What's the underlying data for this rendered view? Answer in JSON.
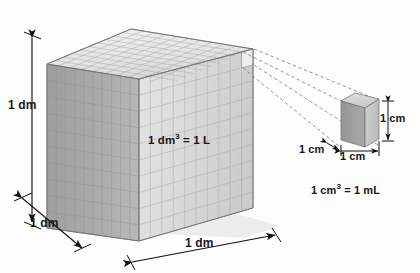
{
  "figure": {
    "background_color": "#fdfdfd",
    "large_cube": {
      "name": "1 cubic decimeter cube",
      "divisions_per_edge": 10,
      "face_label": "1 dm3 = 1 L",
      "face_label_text": "1 dm",
      "face_label_exp": "3",
      "face_label_tail": " = 1 L",
      "edge_labels": {
        "height": "1 dm",
        "depth": "1 dm",
        "width": "1 dm"
      },
      "colors": {
        "top_face": "#e9e9e9",
        "front_face": "#dcdcdc",
        "left_face": "#a8a8a8",
        "grid_line": "#9a9a9a",
        "outline": "#7d7d7d"
      }
    },
    "small_cube": {
      "name": "1 cubic centimeter cube",
      "edge_labels": {
        "height": "1 cm",
        "depth": "1 cm",
        "width": "1 cm"
      },
      "caption_text": "1 cm",
      "caption_exp": "3",
      "caption_tail": " = 1 mL",
      "caption": "1 cm3 = 1 mL",
      "colors": {
        "top_face": "#d3d3d3",
        "front_face": "#c2c2c2",
        "left_face": "#a0a0a0",
        "outline": "#6e6e6e"
      }
    },
    "callout": {
      "name": "dashed magnification leader lines",
      "line_count": 4,
      "style": "dashed",
      "color": "#7a7a7a"
    },
    "dimension_arrows": {
      "color": "#111111",
      "items": [
        {
          "name": "height-arrow",
          "label": "1 dm",
          "orientation": "vertical"
        },
        {
          "name": "depth-arrow",
          "label": "1 dm",
          "orientation": "diagonal"
        },
        {
          "name": "width-arrow",
          "label": "1 dm",
          "orientation": "diagonal"
        },
        {
          "name": "small-height-arrow",
          "label": "1 cm",
          "orientation": "vertical"
        },
        {
          "name": "small-depth-arrow",
          "label": "1 cm",
          "orientation": "diagonal"
        },
        {
          "name": "small-width-arrow",
          "label": "1 cm",
          "orientation": "horizontal"
        }
      ]
    }
  }
}
